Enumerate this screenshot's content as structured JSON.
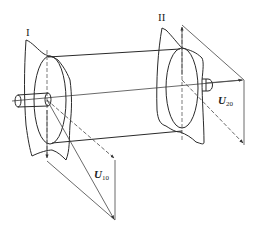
{
  "diagram": {
    "type": "shaft-with-two-correction-planes",
    "planes": [
      {
        "id": "plane-1",
        "label": "I"
      },
      {
        "id": "plane-2",
        "label": "II"
      }
    ],
    "vectors": [
      {
        "id": "u10",
        "symbol": "U",
        "subscript": "10",
        "plane": "I"
      },
      {
        "id": "u20",
        "symbol": "U",
        "subscript": "20",
        "plane": "II"
      }
    ],
    "colors": {
      "stroke": "#2a2a2a",
      "thin_stroke": "#555555",
      "background": "#ffffff"
    }
  }
}
